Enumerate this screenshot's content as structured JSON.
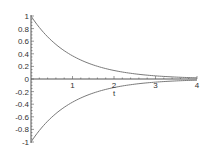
{
  "chart_data": {
    "type": "line",
    "title": "",
    "xlabel": "t",
    "ylabel": "",
    "xlim": [
      0,
      4
    ],
    "ylim": [
      -1,
      1
    ],
    "grid": false,
    "legend": null,
    "x_ticks": [
      "1",
      "2",
      "3",
      "4"
    ],
    "y_ticks": [
      "1",
      "0.8",
      "0.6",
      "0.4",
      "0.2",
      "0",
      "-0.2",
      "-0.4",
      "-0.6",
      "-0.8",
      "-1"
    ],
    "series": [
      {
        "name": "upper",
        "x": [
          0,
          0.5,
          1,
          1.5,
          2,
          2.5,
          3,
          3.5,
          4
        ],
        "values": [
          1.0,
          0.61,
          0.37,
          0.22,
          0.14,
          0.08,
          0.05,
          0.03,
          0.02
        ],
        "color": "#7a7a7a"
      },
      {
        "name": "lower",
        "x": [
          0,
          0.5,
          1,
          1.5,
          2,
          2.5,
          3,
          3.5,
          4
        ],
        "values": [
          -1.0,
          -0.61,
          -0.37,
          -0.22,
          -0.14,
          -0.08,
          -0.05,
          -0.03,
          -0.02
        ],
        "color": "#7a7a7a"
      }
    ]
  },
  "axis_color": "#555555",
  "curve_color": "#7a7a7a"
}
